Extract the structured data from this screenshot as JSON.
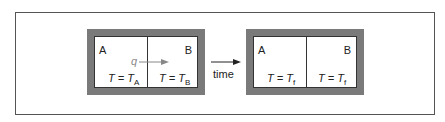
{
  "diagram": {
    "left_box": {
      "label_a": "A",
      "label_b": "B",
      "heat_flow_label": "q",
      "temp_a": {
        "prefix": "T = T",
        "sub": "A"
      },
      "temp_b": {
        "prefix": "T = T",
        "sub": "B"
      }
    },
    "transition": {
      "label": "time"
    },
    "right_box": {
      "label_a": "A",
      "label_b": "B",
      "temp_a": {
        "prefix": "T = T",
        "sub": "f"
      },
      "temp_b": {
        "prefix": "T = T",
        "sub": "f"
      }
    },
    "colors": {
      "wall": "#7a7a7a",
      "heat_arrow": "#888888",
      "line": "#333333"
    }
  }
}
